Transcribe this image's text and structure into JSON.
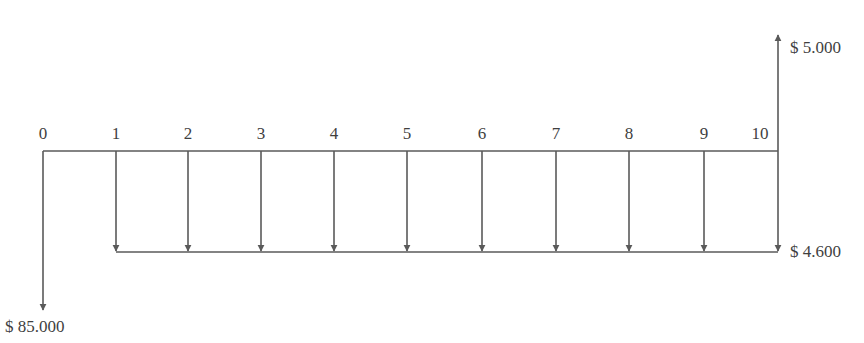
{
  "diagram": {
    "type": "cash-flow-diagram",
    "timeline": {
      "periods": [
        "0",
        "1",
        "2",
        "3",
        "4",
        "5",
        "6",
        "7",
        "8",
        "9",
        "10"
      ],
      "x_positions": [
        43,
        116,
        188,
        261,
        334,
        407,
        482,
        556,
        629,
        704,
        778
      ],
      "axis_y": 151
    },
    "flows": {
      "initial_outflow": {
        "period": "0",
        "direction": "down",
        "label": "$ 85.000"
      },
      "annual_outflows": {
        "from_period": "1",
        "to_period": "10",
        "direction": "down",
        "label": "$ 4.600"
      },
      "final_inflow": {
        "period": "10",
        "direction": "up",
        "label": "$ 5.000"
      }
    },
    "colors": {
      "line": "#5a5a5a",
      "text": "#3f3f3f"
    }
  }
}
